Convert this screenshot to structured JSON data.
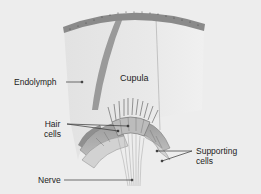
{
  "diagram": {
    "type": "anatomical-illustration",
    "labels": {
      "endolymph": "Endolymph",
      "cupula": "Cupula",
      "hair_cells_line1": "Hair",
      "hair_cells_line2": "cells",
      "supporting_cells_line1": "Supporting",
      "supporting_cells_line2": "cells",
      "nerve": "Nerve"
    },
    "colors": {
      "background": "#ededed",
      "cupula_fill": "#e4e4e4",
      "epithelium_band": "#8a8a8a",
      "cupula_stripe": "#9a9a9a",
      "crista_tissue": "#c8c8c8",
      "leader_line": "#333333",
      "text": "#222222"
    }
  }
}
